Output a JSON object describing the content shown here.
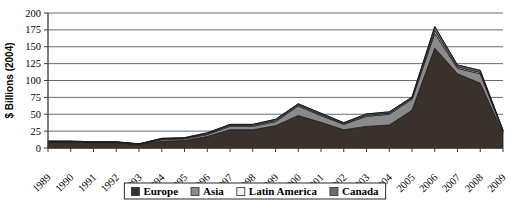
{
  "chart_data": {
    "type": "area",
    "stacked": true,
    "title": "",
    "subtitle": "",
    "xlabel": "",
    "ylabel": "$ Billions (2004)",
    "grid": true,
    "legend_position": "bottom",
    "xlim": [
      1989,
      2009
    ],
    "ylim": [
      0,
      200
    ],
    "ytick_labels": [
      "0",
      "25",
      "50",
      "75",
      "100",
      "125",
      "150",
      "175",
      "200"
    ],
    "ytick_values": [
      0,
      25,
      50,
      75,
      100,
      125,
      150,
      175,
      200
    ],
    "categories": [
      "1989",
      "1990",
      "1991",
      "1992",
      "1993",
      "1994",
      "1995",
      "1996",
      "1997",
      "1998",
      "1999",
      "2000",
      "2001",
      "2002",
      "2003",
      "2004",
      "2005",
      "2006",
      "2007",
      "2008",
      "2009"
    ],
    "series": [
      {
        "name": "Europe",
        "color": "#3a302c",
        "values": [
          9,
          9,
          8,
          8,
          5,
          10,
          11,
          17,
          27,
          27,
          33,
          48,
          38,
          27,
          32,
          34,
          56,
          148,
          110,
          96,
          22
        ]
      },
      {
        "name": "Asia",
        "color": "#8a8a8a",
        "values": [
          0.5,
          0.5,
          0.5,
          0.5,
          0.5,
          2.5,
          2.5,
          3,
          5,
          5,
          6,
          14,
          10,
          8,
          15,
          16,
          16,
          22,
          8,
          14,
          3
        ]
      },
      {
        "name": "Latin America",
        "color": "#f2f2f2",
        "values": [
          0.3,
          0.3,
          0.3,
          0.3,
          0.3,
          0.8,
          0.8,
          1,
          1.5,
          1.5,
          1.5,
          1.5,
          1.5,
          1,
          1.5,
          1.5,
          1.5,
          4,
          2,
          2,
          0.6
        ]
      },
      {
        "name": "Canada",
        "color": "#6e6e6e",
        "values": [
          0.4,
          0.4,
          0.4,
          0.4,
          0.4,
          1,
          1,
          1.5,
          1.5,
          1.5,
          2,
          2,
          2,
          1.5,
          2,
          2,
          2,
          6,
          3,
          3,
          0.8
        ]
      }
    ],
    "totals": [
      10.2,
      10.2,
      9.2,
      9.2,
      6.2,
      14.3,
      15.3,
      22.5,
      35,
      35,
      42.5,
      65.5,
      51.5,
      37.5,
      50.5,
      53.5,
      75.5,
      180,
      123,
      115,
      26.4
    ]
  },
  "legend": {
    "items": [
      {
        "label": "Europe",
        "color": "#3a302c"
      },
      {
        "label": "Asia",
        "color": "#8a8a8a"
      },
      {
        "label": "Latin America",
        "color": "#f2f2f2"
      },
      {
        "label": "Canada",
        "color": "#6e6e6e"
      }
    ]
  },
  "axis": {
    "y_title": "$ Billions (2004)"
  }
}
